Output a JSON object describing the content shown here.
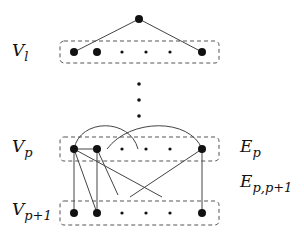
{
  "diagram": {
    "labels": {
      "layer_l": {
        "main": "V",
        "sub": "l"
      },
      "layer_p": {
        "main": "V",
        "sub": "p"
      },
      "layer_p1": {
        "main": "V",
        "sub": "p+1"
      },
      "edges_p": {
        "main": "E",
        "sub": "p"
      },
      "edges_pp1": {
        "main": "E",
        "sub": "p,p+1"
      }
    },
    "colors": {
      "node": "#111111",
      "edge": "#444444",
      "box": "#555555"
    },
    "top_node": {
      "x": 139,
      "y": 19
    },
    "layers": [
      {
        "name": "V_l",
        "y": 52,
        "box": [
          60,
          41,
          159,
          22
        ]
      },
      {
        "name": "V_p",
        "y": 149,
        "box": [
          60,
          137,
          159,
          24
        ]
      },
      {
        "name": "V_p+1",
        "y": 213,
        "box": [
          60,
          201,
          159,
          24
        ]
      }
    ],
    "node_x": [
      74,
      97,
      122,
      146,
      170,
      202
    ],
    "big_nodes": [
      0,
      1,
      5
    ],
    "vertical_ellipsis_y": [
      84,
      100,
      116
    ]
  }
}
